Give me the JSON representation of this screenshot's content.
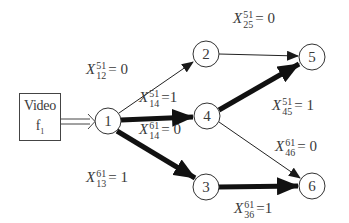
{
  "diagram": {
    "source": {
      "title": "Video",
      "subtitle_base": "f",
      "subtitle_sub": "1"
    },
    "nodes": [
      {
        "id": "1",
        "label": "1",
        "cx": 108,
        "cy": 121
      },
      {
        "id": "2",
        "label": "2",
        "cx": 206,
        "cy": 54
      },
      {
        "id": "3",
        "label": "3",
        "cx": 206,
        "cy": 187
      },
      {
        "id": "4",
        "label": "4",
        "cx": 207,
        "cy": 116
      },
      {
        "id": "5",
        "label": "5",
        "cx": 312,
        "cy": 57
      },
      {
        "id": "6",
        "label": "6",
        "cx": 312,
        "cy": 186
      }
    ],
    "edges": [
      {
        "from": "1",
        "to": "2",
        "weight": "thin",
        "var": "X",
        "sup": "51",
        "sub": "12",
        "value": "0"
      },
      {
        "from": "2",
        "to": "5",
        "weight": "thin",
        "var": "X",
        "sup": "51",
        "sub": "25",
        "value": "0"
      },
      {
        "from": "1",
        "to": "4",
        "weight": "thick",
        "var": "X",
        "sup": "51",
        "sub": "14",
        "value": "1"
      },
      {
        "from": "1",
        "to": "4",
        "weight": "thin",
        "var": "X",
        "sup": "61",
        "sub": "14",
        "value": "0"
      },
      {
        "from": "4",
        "to": "5",
        "weight": "thick",
        "var": "X",
        "sup": "51",
        "sub": "45",
        "value": "1"
      },
      {
        "from": "4",
        "to": "6",
        "weight": "thin",
        "var": "X",
        "sup": "61",
        "sub": "46",
        "value": "0"
      },
      {
        "from": "1",
        "to": "3",
        "weight": "thick",
        "var": "X",
        "sup": "61",
        "sub": "13",
        "value": "1"
      },
      {
        "from": "3",
        "to": "6",
        "weight": "thick",
        "var": "X",
        "sup": "61",
        "sub": "36",
        "value": "1"
      }
    ],
    "eq": "=",
    "colors": {
      "stroke": "#222222",
      "text": "#3a3a3a",
      "background": "#ffffff"
    }
  }
}
